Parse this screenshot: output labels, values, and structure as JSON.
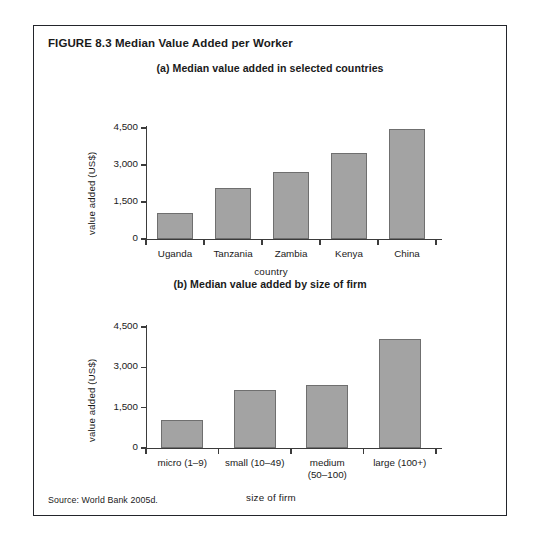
{
  "figure": {
    "title": "FIGURE 8.3  Median Value Added per Worker",
    "source": "Source: World Bank 2005d."
  },
  "chart_data": [
    {
      "type": "bar",
      "panel": "a",
      "title": "(a) Median value added in selected countries",
      "xlabel": "country",
      "ylabel": "value added (US$)",
      "categories": [
        "Uganda",
        "Tanzania",
        "Zambia",
        "Kenya",
        "China"
      ],
      "values": [
        1050,
        2050,
        2700,
        3500,
        4450
      ],
      "ytick_labels": [
        "0",
        "1,500",
        "3,000",
        "4,500"
      ],
      "yticks": [
        0,
        1500,
        3000,
        4500
      ],
      "ylim": [
        0,
        4500
      ],
      "grid": false,
      "legend": "none",
      "bar_color": "#a3a3a3",
      "bar_edge_color": "#6f6f6f"
    },
    {
      "type": "bar",
      "panel": "b",
      "title": "(b) Median value added by size of firm",
      "xlabel": "size of firm",
      "ylabel": "value added (US$)",
      "categories": [
        "micro (1–9)",
        "small (10–49)",
        "medium (50–100)",
        "large (100+)"
      ],
      "category_lines": [
        [
          "micro (1–9)"
        ],
        [
          "small (10–49)"
        ],
        [
          "medium",
          "(50–100)"
        ],
        [
          "large (100+)"
        ]
      ],
      "values": [
        1050,
        2150,
        2350,
        4050
      ],
      "ytick_labels": [
        "0",
        "1,500",
        "3,000",
        "4,500"
      ],
      "yticks": [
        0,
        1500,
        3000,
        4500
      ],
      "ylim": [
        0,
        4500
      ],
      "grid": false,
      "legend": "none",
      "bar_color": "#a3a3a3",
      "bar_edge_color": "#6f6f6f"
    }
  ]
}
